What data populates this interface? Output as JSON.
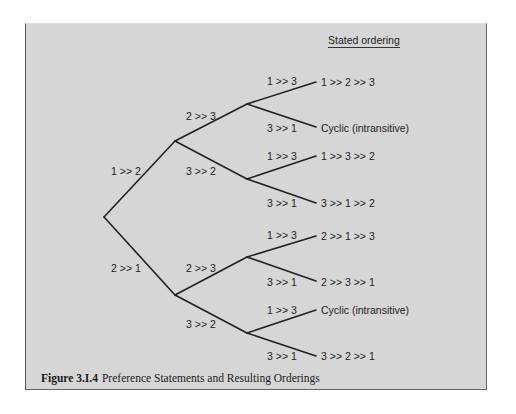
{
  "figure": {
    "header": "Stated ordering",
    "caption_number": "Figure 3.I.4",
    "caption_text": "Preference Statements and Resulting Orderings"
  },
  "tree": {
    "level1": [
      {
        "label": "1 >> 2"
      },
      {
        "label": "2 >> 1"
      }
    ],
    "level2": [
      {
        "label": "2 >> 3"
      },
      {
        "label": "3 >> 2"
      },
      {
        "label": "2 >> 3"
      },
      {
        "label": "3 >> 2"
      }
    ],
    "level3": [
      {
        "label": "1 >> 3",
        "result": "1 >> 2 >> 3"
      },
      {
        "label": "3 >> 1",
        "result": "Cyclic (intransitive)"
      },
      {
        "label": "1 >> 3",
        "result": "1 >> 3 >> 2"
      },
      {
        "label": "3 >> 1",
        "result": "3 >> 1 >> 2"
      },
      {
        "label": "1 >> 3",
        "result": "2 >> 1 >> 3"
      },
      {
        "label": "3 >> 1",
        "result": "2 >> 3 >> 1"
      },
      {
        "label": "1 >> 3",
        "result": "Cyclic (intransitive)"
      },
      {
        "label": "3 >> 1",
        "result": "3 >> 2 >> 1"
      }
    ]
  },
  "colors": {
    "background": "#d6d6d6",
    "line": "#222222"
  }
}
